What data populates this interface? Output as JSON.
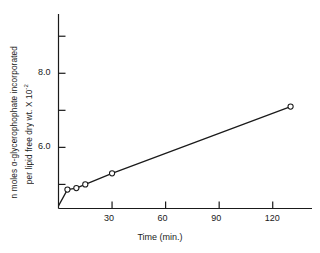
{
  "chart_data": {
    "type": "line",
    "title": "",
    "subtitle": "",
    "xlabel": "Time (min.)",
    "ylabel_line1": "n moles α-glycerophophate incorporated",
    "ylabel_line2_text": "per lipid free dry wt. X 10",
    "ylabel_line2_exponent": "-2",
    "xlim": [
      0,
      142
    ],
    "ylim": [
      4.35,
      9.6
    ],
    "grid": false,
    "legend": "none",
    "marker": "open-circle",
    "xticks": [
      30,
      60,
      90,
      120
    ],
    "xtick_labels": [
      "30",
      "60",
      "90",
      "120"
    ],
    "yticks": [
      5.0,
      6.0,
      7.0,
      8.0,
      9.0
    ],
    "ytick_labels": [
      "",
      "6.0",
      "",
      "8.0",
      ""
    ],
    "series": [
      {
        "name": "α-glycerophosphate incorporation",
        "x": [
          0,
          5,
          10,
          15,
          30,
          130
        ],
        "y": [
          4.42,
          4.86,
          4.9,
          5.0,
          5.3,
          7.1
        ]
      }
    ],
    "points_with_markers": [
      {
        "x": 5,
        "y": 4.86
      },
      {
        "x": 10,
        "y": 4.9
      },
      {
        "x": 15,
        "y": 5.0
      },
      {
        "x": 30,
        "y": 5.3
      },
      {
        "x": 130,
        "y": 7.1
      }
    ],
    "axis_color": "#1a1a1a",
    "line_color": "#1a1a1a",
    "marker_face_color": "#ffffff"
  }
}
